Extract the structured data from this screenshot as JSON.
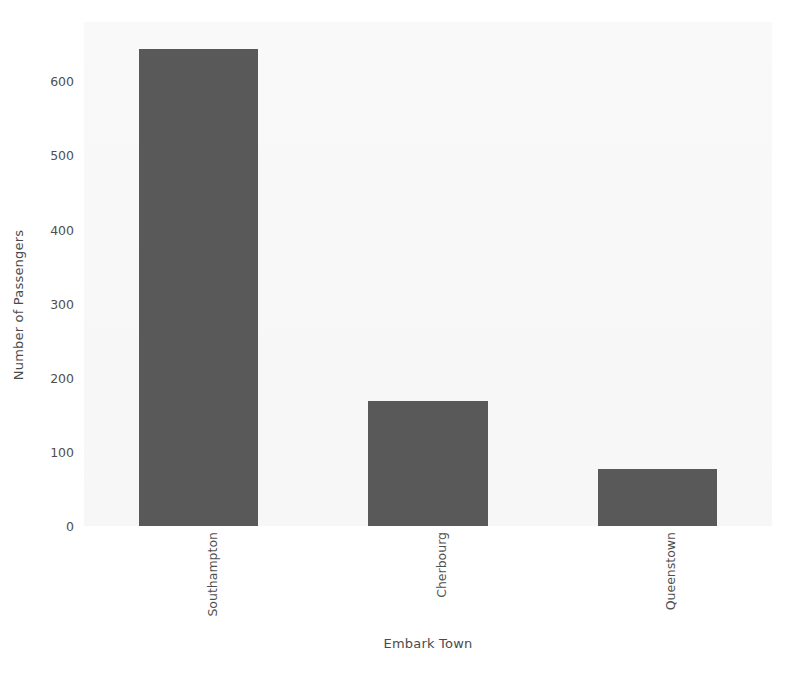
{
  "chart_data": {
    "type": "bar",
    "title": "",
    "subtitle": "",
    "xlabel": "Embark Town",
    "ylabel": "Number of Passengers",
    "categories": [
      "Southampton",
      "Cherbourg",
      "Queenstown"
    ],
    "values": [
      644,
      168,
      77
    ],
    "series": [
      {
        "name": "Number of Passengers",
        "values": [
          644,
          168,
          77
        ]
      }
    ],
    "ylim": [
      0,
      680
    ],
    "xlim": [
      -0.5,
      2.5
    ],
    "ytick_labels": [
      "0",
      "100",
      "200",
      "300",
      "400",
      "500",
      "600"
    ],
    "ytick_values": [
      0,
      100,
      200,
      300,
      400,
      500,
      600
    ],
    "xtick_labels": [
      "Southampton",
      "Cherbourg",
      "Queenstown"
    ],
    "grid": false,
    "legend": null,
    "legend_position": "none",
    "annotations": [],
    "bar_color": "#595959",
    "plot_background": "#f2f2f2",
    "figure_background": "#ffffff",
    "text_color": "#4f4f4f",
    "bar_width_fraction": 0.52,
    "xtick_rotation": 90
  },
  "axis": {
    "y_label": "Number of Passengers",
    "x_label": "Embark Town"
  }
}
